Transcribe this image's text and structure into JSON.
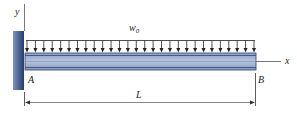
{
  "diagram": {
    "type": "cantilever-beam-uniform-load",
    "labels": {
      "y_axis": "y",
      "x_axis": "x",
      "load": "w",
      "load_subscript": "0",
      "support_end": "A",
      "free_end": "B",
      "length": "L"
    },
    "load_arrow_count": 28,
    "colors": {
      "wall_dark": "#2e4573",
      "wall_light": "#8a9cc0",
      "beam_fill": "#a9b8d6",
      "beam_edge": "#2f4570",
      "line": "#333333"
    }
  }
}
